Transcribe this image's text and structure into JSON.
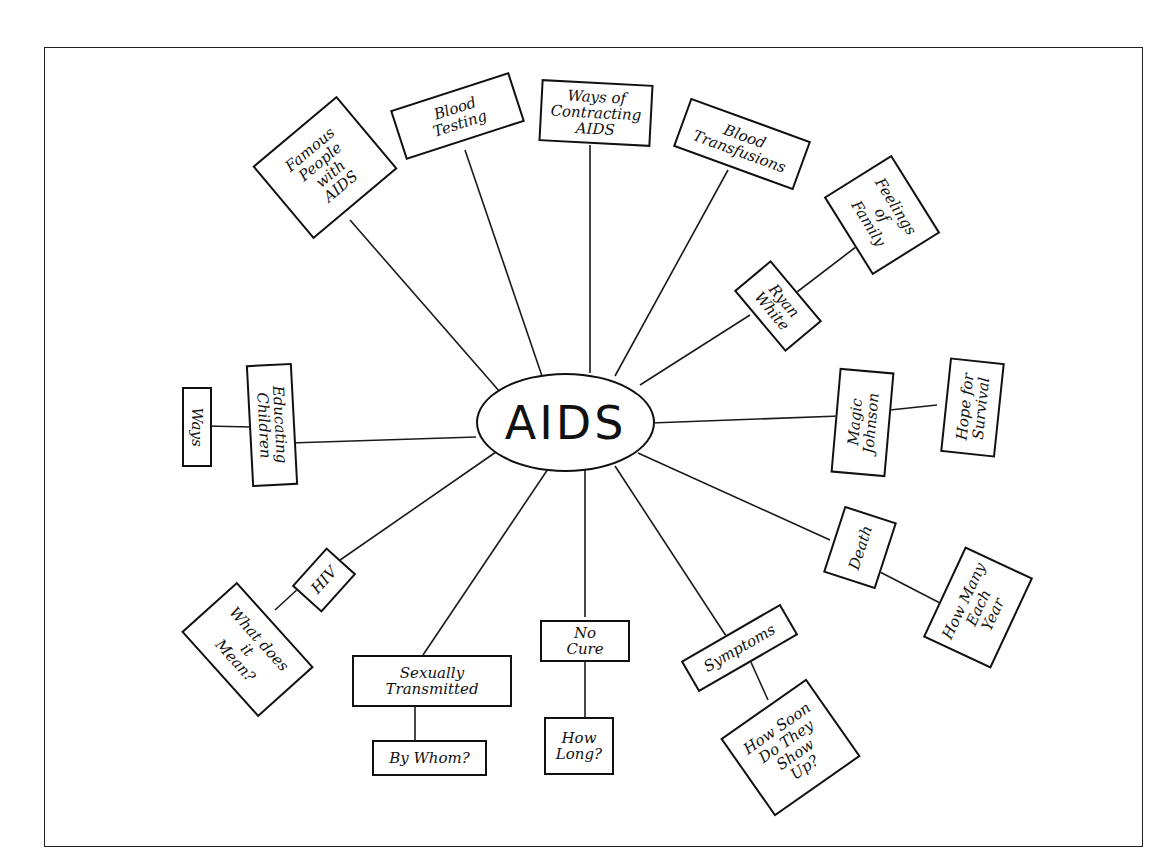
{
  "diagram": {
    "type": "concept-map",
    "center": {
      "label": "AIDS"
    },
    "nodes": {
      "famous_people": {
        "label": "Famous\nPeople\nwith\nAIDS"
      },
      "blood_testing": {
        "label": "Blood\nTesting"
      },
      "ways_contracting": {
        "label": "Ways of\nContracting\nAIDS"
      },
      "blood_transfusions": {
        "label": "Blood\nTransfusions"
      },
      "feelings_family": {
        "label": "Feelings\nof\nFamily"
      },
      "ryan_white": {
        "label": "Ryan\nWhite"
      },
      "magic_johnson": {
        "label": "Magic\nJohnson"
      },
      "hope_survival": {
        "label": "Hope for\nSurvival"
      },
      "death": {
        "label": "Death"
      },
      "how_many": {
        "label": "How Many\nEach\nYear"
      },
      "symptoms": {
        "label": "Symptoms"
      },
      "how_soon": {
        "label": "How Soon\nDo They\nShow\nUp?"
      },
      "no_cure": {
        "label": "No\nCure"
      },
      "how_long": {
        "label": "How\nLong?"
      },
      "sexually_transmitted": {
        "label": "Sexually\nTransmitted"
      },
      "by_whom": {
        "label": "By Whom?"
      },
      "hiv": {
        "label": "HIV"
      },
      "what_mean": {
        "label": "What does\nit\nMean?"
      },
      "educating_children": {
        "label": "Educating\nChildren"
      },
      "ways": {
        "label": "Ways"
      }
    },
    "edges": [
      [
        "AIDS",
        "Famous People with AIDS"
      ],
      [
        "AIDS",
        "Blood Testing"
      ],
      [
        "AIDS",
        "Ways of Contracting AIDS"
      ],
      [
        "AIDS",
        "Blood Transfusions"
      ],
      [
        "AIDS",
        "Ryan White"
      ],
      [
        "Ryan White",
        "Feelings of Family"
      ],
      [
        "AIDS",
        "Magic Johnson"
      ],
      [
        "Magic Johnson",
        "Hope for Survival"
      ],
      [
        "AIDS",
        "Death"
      ],
      [
        "Death",
        "How Many Each Year"
      ],
      [
        "AIDS",
        "Symptoms"
      ],
      [
        "Symptoms",
        "How Soon Do They Show Up?"
      ],
      [
        "AIDS",
        "No Cure"
      ],
      [
        "No Cure",
        "How Long?"
      ],
      [
        "AIDS",
        "Sexually Transmitted"
      ],
      [
        "Sexually Transmitted",
        "By Whom?"
      ],
      [
        "AIDS",
        "HIV"
      ],
      [
        "HIV",
        "What does it Mean?"
      ],
      [
        "AIDS",
        "Educating Children"
      ],
      [
        "Educating Children",
        "Ways"
      ]
    ]
  }
}
